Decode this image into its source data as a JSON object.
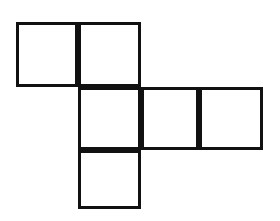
{
  "figure": {
    "kind": "geometry-diagram",
    "name": "cube-net",
    "background_color": "#ffffff",
    "stroke_color": "#111111",
    "fill_color": "#ffffff",
    "stroke_width": 3,
    "canvas": {
      "width": 280,
      "height": 221
    },
    "grid": {
      "square_size": 62,
      "columns_x": [
        16,
        78,
        141,
        199,
        263
      ],
      "rows_y": [
        22,
        87,
        150,
        209
      ],
      "rows": 3,
      "columns": 4
    },
    "square_count": 6,
    "squares": [
      {
        "id": "square-r1c1",
        "row": 1,
        "column": 1,
        "x": 16,
        "y": 22,
        "width": 62,
        "height": 65
      },
      {
        "id": "square-r1c2",
        "row": 1,
        "column": 2,
        "x": 78,
        "y": 22,
        "width": 63,
        "height": 65
      },
      {
        "id": "square-r2c2",
        "row": 2,
        "column": 2,
        "x": 78,
        "y": 87,
        "width": 63,
        "height": 63
      },
      {
        "id": "square-r2c3",
        "row": 2,
        "column": 3,
        "x": 141,
        "y": 87,
        "width": 58,
        "height": 63
      },
      {
        "id": "square-r2c4",
        "row": 2,
        "column": 4,
        "x": 199,
        "y": 87,
        "width": 64,
        "height": 63
      },
      {
        "id": "square-r3c2",
        "row": 3,
        "column": 2,
        "x": 78,
        "y": 150,
        "width": 63,
        "height": 59
      }
    ]
  }
}
